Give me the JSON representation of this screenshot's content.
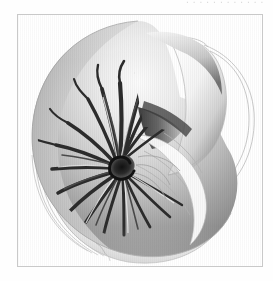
{
  "page": {
    "background_color": "#fdfdfd",
    "width": 273,
    "height": 281
  },
  "caption_remnant": {
    "text": "............",
    "note": "cropped text baseline descenders at top edge"
  },
  "plate": {
    "frame_color": "#c9c9c9",
    "fill_color": "#ffffff",
    "x": 17,
    "y": 14,
    "width": 246,
    "height": 253
  },
  "illustration": {
    "title": "Chambered nautilus shell, cutaway",
    "subject": "nautilus-shell",
    "style": "grayscale scientific airbrush illustration with ink outlines",
    "colors": {
      "shell_light": "#fafafa",
      "shell_mid": "#b9b9b9",
      "shell_dark": "#6e6e6e",
      "stripe_dark": "#2a2a2a",
      "umbilicus": "#1a1a1a",
      "outline": "#9a9a9a",
      "suture_line": "#a8a8a8",
      "aperture_shadow": "#4a4a4a"
    },
    "parts": [
      {
        "name": "body-whorl",
        "label": "Body whorl (dorsal surface)"
      },
      {
        "name": "aperture",
        "label": "Aperture / living chamber opening"
      },
      {
        "name": "flame-stripes",
        "label": "Radial flame stripes"
      },
      {
        "name": "umbilicus",
        "label": "Umbilicus (dark spiral center)"
      },
      {
        "name": "septa-outlines",
        "label": "Septal suture outlines"
      },
      {
        "name": "growth-lines",
        "label": "Radiating growth lines"
      },
      {
        "name": "ghost-outline",
        "label": "Ghosted outer contour lines"
      }
    ],
    "spiral_center": {
      "x": 103,
      "y": 152
    }
  }
}
